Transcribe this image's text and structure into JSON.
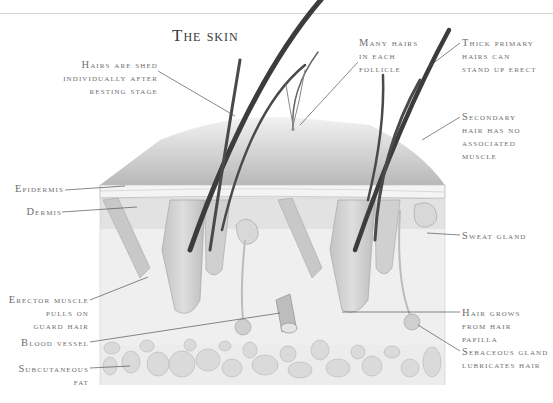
{
  "title": "The skin",
  "labels": {
    "hairs_shed": [
      "Hairs are shed",
      "individually after",
      "resting stage"
    ],
    "many_hairs": [
      "Many hairs",
      "in each",
      "follicle"
    ],
    "thick_primary": [
      "Thick primary",
      "hairs can",
      "stand up erect"
    ],
    "secondary_hair": [
      "Secondary",
      "hair has no",
      "associated",
      "muscle"
    ],
    "epidermis": [
      "Epidermis"
    ],
    "dermis": [
      "Dermis"
    ],
    "sweat_gland": [
      "Sweat gland"
    ],
    "erector_muscle": [
      "Erector muscle",
      "pulls on",
      "guard hair"
    ],
    "blood_vessel": [
      "Blood vessel"
    ],
    "subcutaneous_fat": [
      "Subcutaneous",
      "fat"
    ],
    "hair_grows": [
      "Hair grows",
      "from hair",
      "papilla"
    ],
    "sebaceous_gland": [
      "Sebaceous gland",
      "lubricates hair"
    ]
  },
  "colors": {
    "hair": "#3c3c3c",
    "skin_top": "#c9c9c9",
    "dermis": "#e6e6e6",
    "fat": "#dcdcdc",
    "label_text": "#6e6e6e",
    "leader_line": "#555555"
  }
}
